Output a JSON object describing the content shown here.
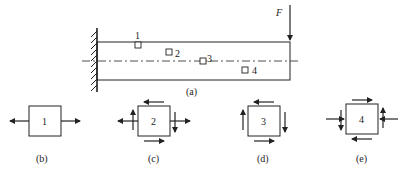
{
  "figure": {
    "beam_diagram": {
      "caption": "(a)",
      "load_label": "F",
      "points": [
        {
          "id": "1",
          "label": "1"
        },
        {
          "id": "2",
          "label": "2"
        },
        {
          "id": "3",
          "label": "3"
        },
        {
          "id": "4",
          "label": "4"
        }
      ]
    },
    "elements": [
      {
        "label": "1",
        "caption": "(b)",
        "stress_state": "uniaxial tension"
      },
      {
        "label": "2",
        "caption": "(c)",
        "stress_state": "tension with shear"
      },
      {
        "label": "3",
        "caption": "(d)",
        "stress_state": "pure shear"
      },
      {
        "label": "4",
        "caption": "(e)",
        "stress_state": "compression with shear"
      }
    ]
  }
}
